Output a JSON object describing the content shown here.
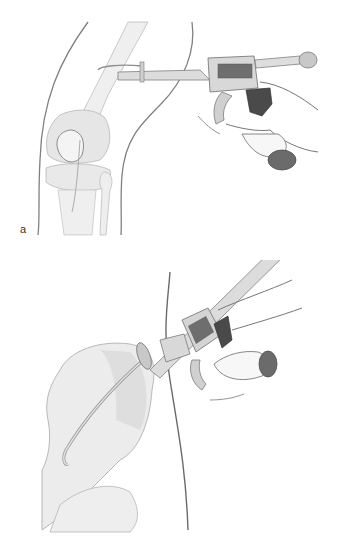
{
  "figure": {
    "panels": [
      {
        "id": "a",
        "label": "a",
        "subject": "knee",
        "description": "Gun-type instrument inserted horizontally above the knee joint; hand gripping trigger"
      },
      {
        "id": "c",
        "label": "c",
        "subject": "pelvis",
        "description": "Gun-type instrument inserted diagonally along the pelvis with curved guide wire; hand gripping trigger"
      }
    ]
  },
  "colors": {
    "background": "#ffffff",
    "outline": "#7a7a7a",
    "bone_fill": "#ececec",
    "bone_shade": "#dcdcdc",
    "instrument_light": "#d6d6d6",
    "instrument_dark": "#6e6e6e",
    "grip_dark": "#4a4a4a",
    "label_text": "#333333"
  }
}
